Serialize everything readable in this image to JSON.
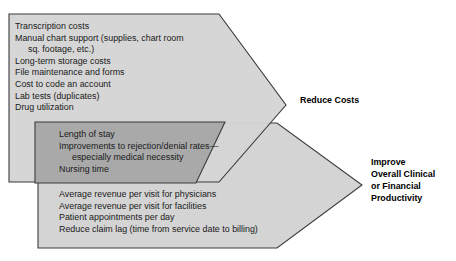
{
  "diagram": {
    "colors": {
      "arrow_light_fill": "#d4d4d4",
      "arrow_dark_fill": "#a9a9a9",
      "arrow_stroke": "#3b3b3b",
      "text": "#1a1a1a",
      "background": "#ffffff"
    },
    "arrows": [
      {
        "id": "reduce-costs-arrow",
        "shade": "light",
        "outcome": "Reduce Costs",
        "items": [
          {
            "text": "Transcription costs",
            "continuation": false
          },
          {
            "text": "Manual chart support (supplies, chart room",
            "continuation": false
          },
          {
            "text": "sq. footage, etc.)",
            "continuation": true
          },
          {
            "text": "Long-term storage costs",
            "continuation": false
          },
          {
            "text": "File maintenance and forms",
            "continuation": false
          },
          {
            "text": "Cost to code an account",
            "continuation": false
          },
          {
            "text": "Lab tests (duplicates)",
            "continuation": false
          },
          {
            "text": "Drug utilization",
            "continuation": false
          }
        ]
      },
      {
        "id": "clinical-quality-arrow",
        "shade": "dark",
        "outcome": "",
        "items": [
          {
            "text": "Length of stay",
            "continuation": false
          },
          {
            "text": "Improvements to rejection/denial rates—",
            "continuation": false
          },
          {
            "text": "especially medical necessity",
            "continuation": true
          },
          {
            "text": "Nursing time",
            "continuation": false
          }
        ]
      },
      {
        "id": "productivity-arrow",
        "shade": "light",
        "outcome": "Improve Overall Clinical or Financial Productivity",
        "items": [
          {
            "text": "Average revenue per visit for physicians",
            "continuation": false
          },
          {
            "text": "Average revenue per visit for facilities",
            "continuation": false
          },
          {
            "text": "Patient appointments per day",
            "continuation": false
          },
          {
            "text": "Reduce claim lag (time from service date to billing)",
            "continuation": false
          }
        ]
      }
    ],
    "outcome_labels": {
      "reduce_costs": {
        "lines": [
          "Reduce Costs"
        ]
      },
      "improve_productivity": {
        "lines": [
          "Improve",
          "Overall Clinical",
          "or Financial",
          "Productivity"
        ]
      }
    }
  }
}
